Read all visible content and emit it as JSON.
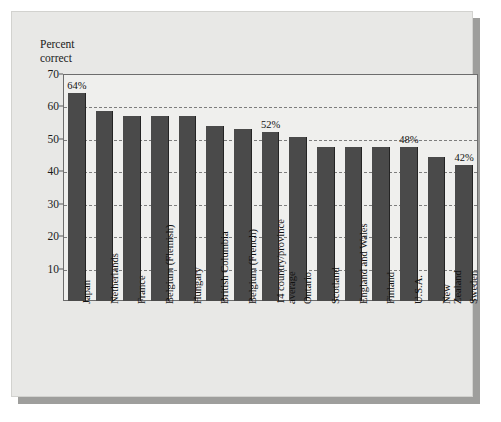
{
  "chart_data": {
    "type": "bar",
    "title": "",
    "subtitle": "",
    "xlabel": "",
    "ylabel": "Percent\ncorrect",
    "ylim": [
      0,
      70
    ],
    "yticks": [
      10,
      20,
      30,
      40,
      50,
      60,
      70
    ],
    "grid": true,
    "legend": null,
    "categories": [
      "Japan",
      "Netherlands",
      "France",
      "Belgium (Flemish)",
      "Hungary",
      "British Columbia",
      "Belgium (French)",
      "14 country/province\naverage",
      "Ontario",
      "Scotland",
      "England and Wales",
      "Finland",
      "U.S.A.",
      "New Zealand",
      "Sweden"
    ],
    "values": [
      64,
      58.5,
      57,
      57,
      57,
      54,
      53,
      52,
      50.5,
      47.5,
      47.5,
      47.5,
      47.5,
      44.5,
      42
    ],
    "annotations": [
      {
        "category": "Japan",
        "text": "64%"
      },
      {
        "category": "14 country/province\naverage",
        "text": "52%"
      },
      {
        "category": "U.S.A.",
        "text": "48%"
      },
      {
        "category": "Sweden",
        "text": "42%"
      }
    ],
    "colors": {
      "bar": "#4a4a4a",
      "bar_edge": "#242424",
      "plot_background": "#efefed",
      "figure_background": "#e8e8e6",
      "gridline": "#7d7d7d",
      "axis": "#6d6d6d",
      "shadow": "#9e9e9c",
      "text": "#111111"
    }
  },
  "axis": {
    "y_title": "Percent\ncorrect",
    "tick_labels": [
      "70",
      "60",
      "50",
      "40",
      "30",
      "20",
      "10"
    ]
  }
}
